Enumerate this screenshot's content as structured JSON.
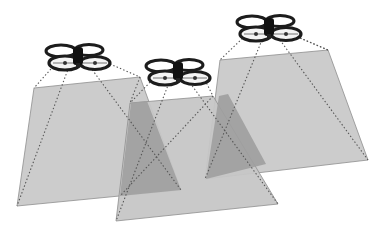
{
  "diagram": {
    "title": "",
    "colors": {
      "background": "#ffffff",
      "footprint_fill": "#c9c9c9",
      "footprint_edge": "#8e8e8e",
      "overlap_fill": "#9b9b9b",
      "ray": "#555555",
      "drone_body": "#1c1c1c"
    },
    "drones": [
      {
        "id": "drone-1",
        "center": [
          77,
          57
        ],
        "footprint": [
          [
            34,
            88
          ],
          [
            140,
            77
          ],
          [
            181,
            190
          ],
          [
            17,
            206
          ]
        ]
      },
      {
        "id": "drone-2",
        "center": [
          177,
          72
        ],
        "footprint": [
          [
            130,
            103
          ],
          [
            213,
            96
          ],
          [
            278,
            204
          ],
          [
            116,
            221
          ]
        ]
      },
      {
        "id": "drone-3",
        "center": [
          268,
          28
        ],
        "footprint": [
          [
            220,
            60
          ],
          [
            328,
            50
          ],
          [
            368,
            160
          ],
          [
            205,
            179
          ]
        ]
      }
    ],
    "overlaps": [
      [
        [
          130,
          103
        ],
        [
          150,
          101
        ],
        [
          181,
          190
        ],
        [
          120,
          196
        ]
      ],
      [
        [
          219,
          96
        ],
        [
          235,
          92
        ],
        [
          266,
          164
        ],
        [
          205,
          179
        ]
      ]
    ]
  }
}
